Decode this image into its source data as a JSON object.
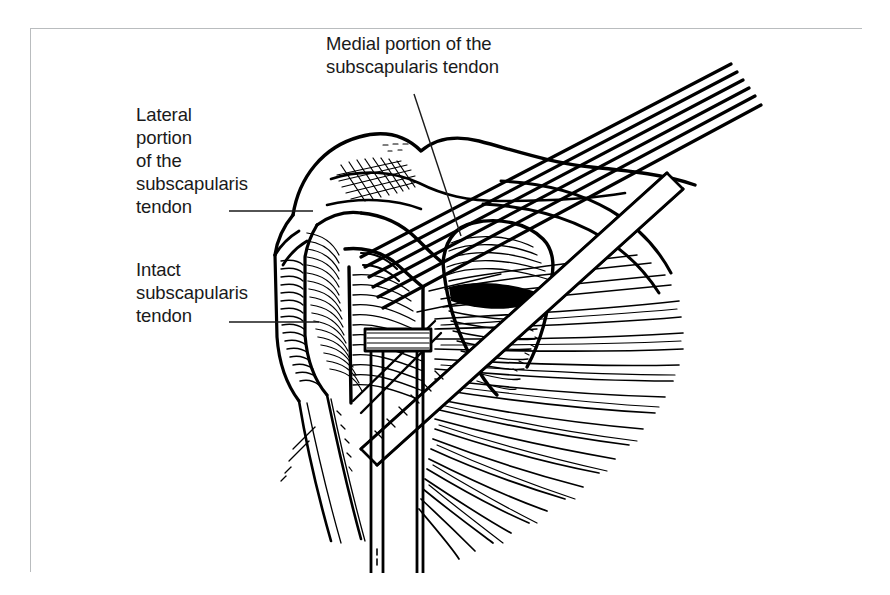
{
  "figure": {
    "kind": "anatomical-line-illustration",
    "frame_color": "#b9bcbe",
    "ink_color": "#000000",
    "background_color": "#ffffff"
  },
  "labels": {
    "medial": "Medial portion of the\nsubscapularis tendon",
    "lateral": "Lateral\nportion\nof the\nsubscapularis\ntendon",
    "intact": "Intact\nsubscapularis\ntendon"
  },
  "leader_lines": [
    {
      "name": "medial-leader",
      "x1": 414,
      "y1": 94,
      "x2": 461,
      "y2": 236
    },
    {
      "name": "lateral-leader",
      "x1": 229,
      "y1": 211,
      "x2": 313,
      "y2": 211
    },
    {
      "name": "intact-leader",
      "x1": 229,
      "y1": 322,
      "x2": 319,
      "y2": 322
    }
  ]
}
